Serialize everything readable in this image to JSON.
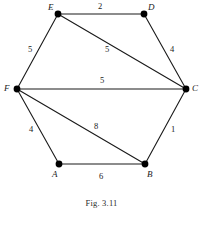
{
  "figure": {
    "caption": "Fig. 3.11",
    "colors": {
      "edge": "#1a1a1a",
      "vertex": "#000000",
      "text": "#1a1a1a",
      "background": "#ffffff"
    }
  },
  "graph": {
    "vertices": [
      {
        "id": "E",
        "label": "E",
        "cx": 58,
        "cy": 14,
        "r": 3.4,
        "label_x": 48,
        "label_y": 3
      },
      {
        "id": "D",
        "label": "D",
        "cx": 144,
        "cy": 14,
        "r": 3.4,
        "label_x": 148,
        "label_y": 3
      },
      {
        "id": "C",
        "label": "C",
        "cx": 186,
        "cy": 89,
        "r": 3.4,
        "label_x": 192,
        "label_y": 84
      },
      {
        "id": "B",
        "label": "B",
        "cx": 145,
        "cy": 164,
        "r": 3.4,
        "label_x": 147,
        "label_y": 170
      },
      {
        "id": "A",
        "label": "A",
        "cx": 59,
        "cy": 164,
        "r": 3.4,
        "label_x": 52,
        "label_y": 170
      },
      {
        "id": "F",
        "label": "F",
        "cx": 17,
        "cy": 89,
        "r": 3.4,
        "label_x": 4,
        "label_y": 84
      }
    ],
    "edges": [
      {
        "from": "E",
        "to": "D",
        "weight": "2",
        "x1": 58,
        "y1": 14,
        "x2": 144,
        "y2": 14,
        "label_x": 98,
        "label_y": 2
      },
      {
        "from": "D",
        "to": "C",
        "weight": "4",
        "x1": 144,
        "y1": 14,
        "x2": 186,
        "y2": 89,
        "label_x": 170,
        "label_y": 45
      },
      {
        "from": "E",
        "to": "F",
        "weight": "5",
        "x1": 58,
        "y1": 14,
        "x2": 17,
        "y2": 89,
        "label_x": 28,
        "label_y": 45
      },
      {
        "from": "E",
        "to": "C",
        "weight": "5",
        "x1": 58,
        "y1": 14,
        "x2": 186,
        "y2": 89,
        "label_x": 105,
        "label_y": 45
      },
      {
        "from": "F",
        "to": "C",
        "weight": "5",
        "x1": 17,
        "y1": 89,
        "x2": 186,
        "y2": 89,
        "label_x": 100,
        "label_y": 76
      },
      {
        "from": "F",
        "to": "A",
        "weight": "4",
        "x1": 17,
        "y1": 89,
        "x2": 59,
        "y2": 164,
        "label_x": 29,
        "label_y": 125
      },
      {
        "from": "F",
        "to": "B",
        "weight": "8",
        "x1": 17,
        "y1": 89,
        "x2": 145,
        "y2": 164,
        "label_x": 94,
        "label_y": 122
      },
      {
        "from": "C",
        "to": "B",
        "weight": "1",
        "x1": 186,
        "y1": 89,
        "x2": 145,
        "y2": 164,
        "label_x": 171,
        "label_y": 125
      },
      {
        "from": "A",
        "to": "B",
        "weight": "6",
        "x1": 59,
        "y1": 164,
        "x2": 145,
        "y2": 164,
        "label_x": 99,
        "label_y": 172
      }
    ]
  },
  "chart_data": {
    "type": "diagram",
    "title": "Fig. 3.11",
    "nodes": [
      "A",
      "B",
      "C",
      "D",
      "E",
      "F"
    ],
    "edges": [
      {
        "source": "E",
        "target": "D",
        "weight": 2
      },
      {
        "source": "D",
        "target": "C",
        "weight": 4
      },
      {
        "source": "E",
        "target": "F",
        "weight": 5
      },
      {
        "source": "E",
        "target": "C",
        "weight": 5
      },
      {
        "source": "F",
        "target": "C",
        "weight": 5
      },
      {
        "source": "F",
        "target": "A",
        "weight": 4
      },
      {
        "source": "F",
        "target": "B",
        "weight": 8
      },
      {
        "source": "C",
        "target": "B",
        "weight": 1
      },
      {
        "source": "A",
        "target": "B",
        "weight": 6
      }
    ]
  }
}
